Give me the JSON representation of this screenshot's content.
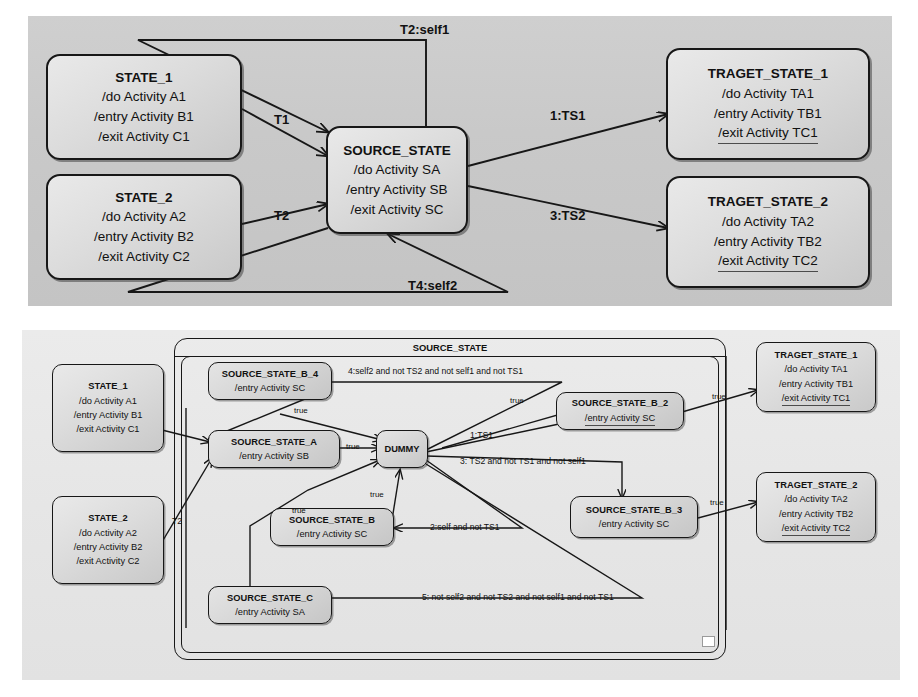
{
  "diagram": {
    "colors": {
      "top_background": "#c9c9c9",
      "bottom_background": "#e6e6e6",
      "state_fill": "#dcdcdc",
      "stroke": "#171717",
      "handle": "#ffffff"
    }
  },
  "top": {
    "states": {
      "state_1": {
        "name": "STATE_1",
        "lines": [
          "/do Activity A1",
          "/entry Activity B1",
          "/exit Activity C1"
        ]
      },
      "state_2": {
        "name": "STATE_2",
        "lines": [
          "/do Activity A2",
          "/entry Activity B2",
          "/exit Activity C2"
        ]
      },
      "source_state": {
        "name": "SOURCE_STATE",
        "lines": [
          "/do Activity SA",
          "/entry Activity SB",
          "/exit Activity SC"
        ]
      },
      "target_state_1": {
        "name": "TRAGET_STATE_1",
        "lines": [
          "/do Activity TA1",
          "/entry Activity TB1",
          "/exit Activity TC1"
        ]
      },
      "target_state_2": {
        "name": "TRAGET_STATE_2",
        "lines": [
          "/do Activity TA2",
          "/entry Activity TB2",
          "/exit Activity TC2"
        ]
      }
    },
    "transitions": {
      "t1": "T1",
      "t2": "T2",
      "t2_self1": "T2:self1",
      "t4_self2": "T4:self2",
      "ts1": "1:TS1",
      "ts2": "3:TS2"
    }
  },
  "bottom": {
    "composite": {
      "name": "SOURCE_STATE"
    },
    "states": {
      "state_1": {
        "name": "STATE_1",
        "lines": [
          "/do Activity A1",
          "/entry Activity B1",
          "/exit Activity C1"
        ]
      },
      "state_2": {
        "name": "STATE_2",
        "lines": [
          "/do Activity A2",
          "/entry Activity B2",
          "/exit Activity C2"
        ]
      },
      "source_state_b_4": {
        "name": "SOURCE_STATE_B_4",
        "lines": [
          "/entry Activity SC"
        ]
      },
      "source_state_a": {
        "name": "SOURCE_STATE_A",
        "lines": [
          "/entry Activity SB"
        ]
      },
      "source_state_b": {
        "name": "SOURCE_STATE_B",
        "lines": [
          "/entry Activity SC"
        ]
      },
      "source_state_c": {
        "name": "SOURCE_STATE_C",
        "lines": [
          "/entry Activity SA"
        ]
      },
      "source_state_b_2": {
        "name": "SOURCE_STATE_B_2",
        "lines": [
          "/entry Activity SC"
        ]
      },
      "source_state_b_3": {
        "name": "SOURCE_STATE_B_3",
        "lines": [
          "/entry Activity SC"
        ]
      },
      "dummy": {
        "name": "DUMMY"
      },
      "target_state_1": {
        "name": "TRAGET_STATE_1",
        "lines": [
          "/do Activity TA1",
          "/entry Activity TB1",
          "/exit Activity TC1"
        ]
      },
      "target_state_2": {
        "name": "TRAGET_STATE_2",
        "lines": [
          "/do Activity TA2",
          "/entry Activity TB2",
          "/exit Activity TC2"
        ]
      }
    },
    "transitions": {
      "t1": "T1",
      "t2": "T2",
      "guard_4": "4:self2 and not TS2 and not self1 and not TS1",
      "guard_1": "1:TS1",
      "guard_3": "3: TS2 and not TS1 and not self1",
      "guard_2": "2:self and not TS1",
      "guard_5": "5: not self2 and not TS2 and not self1 and not TS1",
      "true_a": "true",
      "true_b": "true",
      "true_c": "true",
      "true_d": "true",
      "true_e": "true",
      "true_f": "true",
      "true_g": "true"
    }
  }
}
